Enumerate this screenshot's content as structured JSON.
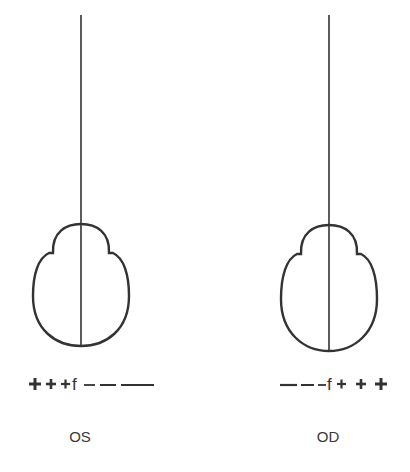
{
  "diagram": {
    "stroke_color": "#333333",
    "panels": [
      {
        "id": "left",
        "eye_label": "OS",
        "scale": [
          "+",
          "+",
          "+",
          "f",
          "–",
          "–",
          "—"
        ],
        "scale_text": "+++f–––"
      },
      {
        "id": "right",
        "eye_label": "OD",
        "scale": [
          "—",
          "–",
          "–",
          "f",
          "+",
          "+",
          "+"
        ],
        "scale_text": "–––f+++"
      }
    ]
  }
}
